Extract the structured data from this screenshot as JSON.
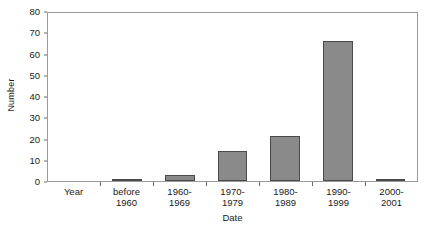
{
  "chart_data": {
    "type": "bar",
    "title": "",
    "xlabel": "Date",
    "ylabel": "Number",
    "categories": [
      "Year",
      "before\n1960",
      "1960-\n1969",
      "1970-\n1979",
      "1980-\n1989",
      "1990-\n1999",
      "2000-\n2001"
    ],
    "values": [
      0,
      1,
      3,
      14,
      21,
      66,
      1
    ],
    "ylim": [
      0,
      80
    ],
    "yticks": [
      0,
      10,
      20,
      30,
      40,
      50,
      60,
      70,
      80
    ],
    "ytick_labels": [
      "0",
      "10",
      "20",
      "30",
      "40",
      "50",
      "60",
      "70",
      "80"
    ],
    "grid": false,
    "legend": false,
    "bar_color": "#8a8a8a",
    "bar_edge_color": "#4a4a4a",
    "frame_color": "#9a9a9a"
  }
}
